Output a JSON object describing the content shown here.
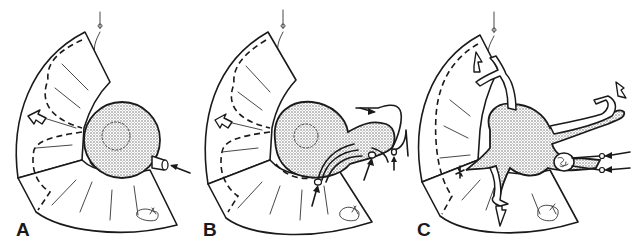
{
  "figure": {
    "panels": [
      {
        "label": "A",
        "depicts": "flap with spherical expander balloon, single inflation arrow"
      },
      {
        "label": "B",
        "depicts": "flap with balloon and multiple catheters, inflow arrows"
      },
      {
        "label": "C",
        "depicts": "flap with branched vascular tissue, open outflow arrows and suture mark"
      }
    ]
  }
}
